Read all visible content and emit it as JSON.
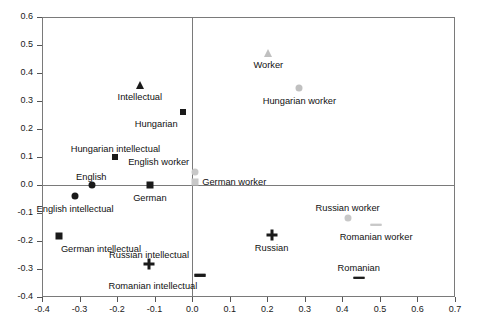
{
  "chart_data": {
    "type": "scatter",
    "title": "",
    "xlabel": "",
    "ylabel": "",
    "xlim": [
      -0.4,
      0.7
    ],
    "ylim": [
      -0.4,
      0.6
    ],
    "grid": false,
    "legend": "none",
    "zero_lines": true,
    "xticks": [
      "-0.4",
      "-0.3",
      "-0.2",
      "-0.1",
      "0.0",
      "0.1",
      "0.2",
      "0.3",
      "0.4",
      "0.5",
      "0.6",
      "0.7"
    ],
    "xtick_values": [
      -0.4,
      -0.3,
      -0.2,
      -0.1,
      0.0,
      0.1,
      0.2,
      0.3,
      0.4,
      0.5,
      0.6,
      0.7
    ],
    "yticks": [
      "0.6",
      "0.5",
      "0.4",
      "0.3",
      "0.2",
      "0.1",
      "0.0",
      "-0.1",
      "-0.2",
      "-0.3",
      "-0.4"
    ],
    "ytick_values": [
      0.6,
      0.5,
      0.4,
      0.3,
      0.2,
      0.1,
      0.0,
      -0.1,
      -0.2,
      -0.3,
      -0.4
    ],
    "colors": {
      "dark": "#1a1a1a",
      "light": "#c8c8c8",
      "frame": "#7a7a7a",
      "text": "#111111"
    },
    "points": [
      {
        "label": "Intellectual",
        "x": -0.14,
        "y": 0.358,
        "marker": "triangle",
        "color": "#1a1a1a",
        "label_dx": 0,
        "label_dy": 13,
        "label_anchor": "center"
      },
      {
        "label": "Hungarian",
        "x": -0.025,
        "y": 0.262,
        "marker": "diamond",
        "color": "#1a1a1a",
        "label_dx": -5,
        "label_dy": 13,
        "label_anchor": "right"
      },
      {
        "label": "Hungarian intellectual",
        "x": -0.205,
        "y": 0.1,
        "marker": "diamond",
        "color": "#1a1a1a",
        "label_dx": 0,
        "label_dy": -7,
        "label_anchor": "center"
      },
      {
        "label": "English",
        "x": -0.268,
        "y": 0.0,
        "marker": "circle",
        "color": "#1a1a1a",
        "label_dx": 0,
        "label_dy": -7,
        "label_anchor": "center"
      },
      {
        "label": "German",
        "x": -0.112,
        "y": 0.0,
        "marker": "square",
        "color": "#1a1a1a",
        "label_dx": 0,
        "label_dy": 14,
        "label_anchor": "center"
      },
      {
        "label": "English intellectual",
        "x": -0.312,
        "y": -0.04,
        "marker": "circle",
        "color": "#1a1a1a",
        "label_dx": 0,
        "label_dy": 14,
        "label_anchor": "center"
      },
      {
        "label": "German intellectual",
        "x": -0.355,
        "y": -0.182,
        "marker": "square",
        "color": "#1a1a1a",
        "label_dx": 2,
        "label_dy": 14,
        "label_anchor": "left"
      },
      {
        "label": "Russian intellectual",
        "x": -0.115,
        "y": -0.283,
        "marker": "plus",
        "color": "#1a1a1a",
        "label_dx": 0,
        "label_dy": -8,
        "label_anchor": "center"
      },
      {
        "label": "Romanian intellectual",
        "x": 0.022,
        "y": -0.322,
        "marker": "cross",
        "color": "#1a1a1a",
        "label_dx": -3,
        "label_dy": 12,
        "label_anchor": "right"
      },
      {
        "label": "Russian",
        "x": 0.212,
        "y": -0.178,
        "marker": "plus",
        "color": "#1a1a1a",
        "label_dx": 0,
        "label_dy": 14,
        "label_anchor": "center"
      },
      {
        "label": "Romanian",
        "x": 0.443,
        "y": -0.332,
        "marker": "cross",
        "color": "#1a1a1a",
        "label_dx": 0,
        "label_dy": -9,
        "label_anchor": "center"
      },
      {
        "label": "Worker",
        "x": 0.203,
        "y": 0.473,
        "marker": "triangle",
        "color": "#c0c0c0",
        "label_dx": 0,
        "label_dy": 13,
        "label_anchor": "center"
      },
      {
        "label": "Hungarian worker",
        "x": 0.285,
        "y": 0.348,
        "marker": "circle",
        "color": "#c0c0c0",
        "label_dx": 0,
        "label_dy": 14,
        "label_anchor": "center"
      },
      {
        "label": "English worker",
        "x": 0.008,
        "y": 0.047,
        "marker": "circle",
        "color": "#c8c8c8",
        "label_dx": -6,
        "label_dy": -9,
        "label_anchor": "right"
      },
      {
        "label": "German worker",
        "x": 0.008,
        "y": 0.012,
        "marker": "square",
        "color": "#c8c8c8",
        "label_dx": 7,
        "label_dy": 1,
        "label_anchor": "left"
      },
      {
        "label": "Russian worker",
        "x": 0.414,
        "y": -0.118,
        "marker": "circle",
        "color": "#c8c8c8",
        "label_dx": 0,
        "label_dy": -9,
        "label_anchor": "center"
      },
      {
        "label": "Romanian worker",
        "x": 0.49,
        "y": -0.142,
        "marker": "cross",
        "color": "#c8c8c8",
        "label_dx": 0,
        "label_dy": 13,
        "label_anchor": "center"
      }
    ]
  }
}
